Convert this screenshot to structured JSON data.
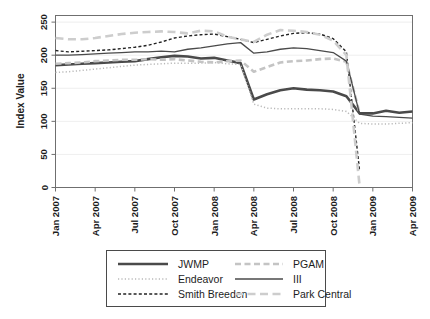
{
  "chart_data": {
    "type": "line",
    "title": "",
    "xlabel": "",
    "ylabel": "Index Value",
    "ylim": [
      0,
      260
    ],
    "yticks": [
      0,
      50,
      100,
      150,
      200,
      250
    ],
    "ytick_labels": [
      "0",
      "50",
      "100",
      "150",
      "200",
      "250"
    ],
    "grid": true,
    "grid_axis": "y",
    "legend_position": "below-center",
    "x": [
      "Jan 2007",
      "Feb 2007",
      "Mar 2007",
      "Apr 2007",
      "May 2007",
      "Jun 2007",
      "Jul 2007",
      "Aug 2007",
      "Sep 2007",
      "Oct 2007",
      "Nov 2007",
      "Dec 2007",
      "Jan 2008",
      "Feb 2008",
      "Mar 2008",
      "Apr 2008",
      "May 2008",
      "Jun 2008",
      "Jul 2008",
      "Aug 2008",
      "Sep 2008",
      "Oct 2008",
      "Nov 2008",
      "Dec 2008",
      "Jan 2009",
      "Feb 2009",
      "Mar 2009",
      "Apr 2009"
    ],
    "xticks": [
      "Jan 2007",
      "Apr 2007",
      "Jul 2007",
      "Oct 2007",
      "Jan 2008",
      "Apr 2008",
      "Jul 2008",
      "Oct 2008",
      "Jan 2009",
      "Apr 2009"
    ],
    "xtick_indices": [
      0,
      3,
      6,
      9,
      12,
      15,
      18,
      21,
      24,
      27
    ],
    "series": [
      {
        "name": "JWMP",
        "style": "solid",
        "color": "#4a4a4a",
        "width": 2.6,
        "values": [
          185,
          186,
          187,
          188,
          189,
          190,
          191,
          194,
          197,
          199,
          198,
          195,
          196,
          192,
          188,
          133,
          141,
          147,
          150,
          148,
          147,
          145,
          138,
          112,
          112,
          116,
          113,
          115
        ]
      },
      {
        "name": "Endeavor",
        "style": "dotted",
        "color": "#b9b9b9",
        "width": 1.5,
        "values": [
          174,
          175,
          177,
          179,
          181,
          183,
          185,
          186,
          187,
          188,
          188,
          188,
          189,
          187,
          186,
          126,
          120,
          119,
          119,
          119,
          119,
          118,
          115,
          97,
          96,
          96,
          97,
          98
        ]
      },
      {
        "name": "Smith Breeden",
        "style": "dashed",
        "color": "#222222",
        "width": 1.4,
        "values": [
          207,
          205,
          206,
          207,
          208,
          210,
          212,
          215,
          220,
          226,
          229,
          231,
          232,
          228,
          224,
          219,
          224,
          229,
          233,
          234,
          232,
          225,
          205,
          25,
          null,
          null,
          null,
          null
        ]
      },
      {
        "name": "PGAM",
        "style": "dashed-wide",
        "color": "#c4c4c4",
        "width": 2.6,
        "values": [
          187,
          188,
          189,
          191,
          192,
          193,
          193,
          194,
          193,
          194,
          192,
          190,
          189,
          191,
          192,
          175,
          182,
          189,
          191,
          192,
          194,
          195,
          190,
          112,
          null,
          null,
          null,
          null
        ]
      },
      {
        "name": "III",
        "style": "solid",
        "color": "#4a4a4a",
        "width": 1.3,
        "values": [
          200,
          200,
          201,
          202,
          203,
          204,
          205,
          205,
          206,
          205,
          209,
          211,
          214,
          217,
          219,
          203,
          205,
          209,
          211,
          210,
          207,
          204,
          191,
          111,
          108,
          107,
          106,
          105
        ]
      },
      {
        "name": "Park Central",
        "style": "longdash",
        "color": "#cdcdcd",
        "width": 2.6,
        "values": [
          226,
          224,
          224,
          226,
          229,
          232,
          234,
          235,
          236,
          235,
          233,
          237,
          236,
          228,
          224,
          220,
          231,
          238,
          237,
          235,
          231,
          222,
          200,
          2,
          null,
          null,
          null,
          null
        ]
      }
    ]
  },
  "axis": {
    "ylabel": "Index Value"
  },
  "legend": {
    "entries": [
      {
        "label": "JWMP",
        "series": "JWMP"
      },
      {
        "label": "PGAM",
        "series": "PGAM"
      },
      {
        "label": "Endeavor",
        "series": "Endeavor"
      },
      {
        "label": "III",
        "series": "III"
      },
      {
        "label": "Smith Breeden",
        "series": "Smith Breeden"
      },
      {
        "label": "Park Central",
        "series": "Park Central"
      }
    ]
  }
}
